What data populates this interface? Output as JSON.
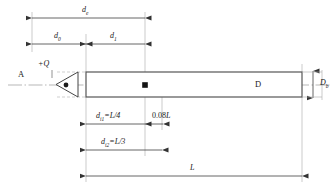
{
  "figure": {
    "type": "engineering-dimension-drawing",
    "colors": {
      "line": "#404040",
      "bar_outline": "#555555",
      "centerline": "#9a9a9a",
      "dimension": "#333333",
      "text": "#1a1a1a",
      "background": "#ffffff"
    }
  },
  "labels": {
    "point_a": "A",
    "charge": "+Q",
    "bar_diameter_inline": "D",
    "bar_height": "D",
    "bar_height_sub": "b",
    "dim_total_top": "d",
    "dim_total_top_sub": "e",
    "dim_d0": "d",
    "dim_d0_sub": "0",
    "dim_d1": "d",
    "dim_d1_sub": "1",
    "dim_i1": "d",
    "dim_i1_sub": "i1",
    "dim_i1_value": "=L/4",
    "dim_offset": "0.08",
    "dim_offset_unit": "L",
    "dim_i2": "d",
    "dim_i2_sub": "i2",
    "dim_i2_value": "=L/3",
    "dim_length": "L"
  },
  "geometry": {
    "bar_left_x": 86,
    "bar_right_x": 302,
    "bar_top_y": 72,
    "bar_bottom_y": 97,
    "axis_y": 85,
    "cone_tip_x": 78,
    "cone_base_x": 56,
    "marker_x": 145,
    "dim_top_e_y": 18,
    "dim_top_01_y": 44,
    "dim_i1_y": 124,
    "dim_i2_y": 150,
    "dim_L_y": 176,
    "dim_left_origin_x": 32,
    "dim_split_x": 86
  },
  "dimensions": {
    "total_length": "L",
    "bar_diameter": "D",
    "bore_diameter": "Db",
    "charge_offset_1": "L/4",
    "charge_offset_2": "L/3",
    "local_offset": "0.08L"
  }
}
